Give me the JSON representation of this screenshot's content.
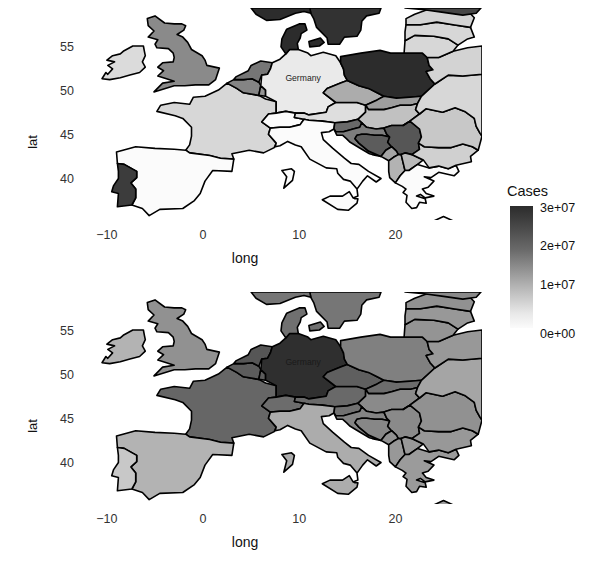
{
  "figure": {
    "type": "choropleth-map-pair",
    "region": "Europe"
  },
  "panels": [
    {
      "id": "top",
      "axis": {
        "xlabel": "long",
        "ylabel": "lat",
        "xticks": [
          "-10",
          "0",
          "10",
          "20"
        ],
        "xtick_values": [
          -10,
          0,
          10,
          20
        ],
        "yticks": [
          "55",
          "50",
          "45",
          "40"
        ],
        "ytick_values": [
          55,
          50,
          45,
          40
        ],
        "xlim": [
          -13,
          29
        ],
        "ylim": [
          35.5,
          59.5
        ]
      },
      "annotation": {
        "label": "Germany",
        "long": 10.4,
        "lat": 51.2,
        "text_color": "#222222"
      }
    },
    {
      "id": "bottom",
      "axis": {
        "xlabel": "long",
        "ylabel": "lat",
        "xticks": [
          "-10",
          "0",
          "10",
          "20"
        ],
        "xtick_values": [
          -10,
          0,
          10,
          20
        ],
        "yticks": [
          "55",
          "50",
          "45",
          "40"
        ],
        "ytick_values": [
          55,
          50,
          45,
          40
        ],
        "xlim": [
          -13,
          29
        ],
        "ylim": [
          35.5,
          59.5
        ]
      },
      "annotation": {
        "label": "Germany",
        "long": 10.4,
        "lat": 51.2,
        "text_color": "#1a1a1a"
      }
    }
  ],
  "legend": {
    "title": "Cases",
    "ticks": [
      "3e+07",
      "2e+07",
      "1e+07",
      "0e+00"
    ],
    "tick_values": [
      30000000,
      20000000,
      10000000,
      0
    ],
    "gradient_high_color": "#2c2c2c",
    "gradient_low_color": "#fbfbfb",
    "orientation": "vertical"
  },
  "chart_data": {
    "type": "heatmap",
    "title": "",
    "xlabel": "long",
    "ylabel": "lat",
    "legend_title": "Cases",
    "legend_ticks": [
      0,
      10000000,
      20000000,
      30000000
    ],
    "legend_tick_labels": [
      "0e+00",
      "1e+07",
      "2e+07",
      "3e+07"
    ],
    "xlim": [
      -13,
      29
    ],
    "ylim": [
      35.5,
      59.5
    ],
    "grid": false,
    "legend_position": "right",
    "panels": [
      {
        "name": "top",
        "annotation": "Germany",
        "values": {
          "Ireland": 4000000,
          "United Kingdom": 15500000,
          "France": 4500000,
          "Spain": 0,
          "Portugal": 27500000,
          "Belgium": 16500000,
          "Netherlands": 18500000,
          "Luxembourg": 14000000,
          "Germany": 2000000,
          "Switzerland": 0,
          "Austria": 3500000,
          "Italy": 0,
          "Denmark": 30000000,
          "Norway": 30000000,
          "Sweden": 29000000,
          "Finland": 26000000,
          "Poland": 30000000,
          "Czechia": 10500000,
          "Slovakia": 12500000,
          "Hungary": 7500000,
          "Slovenia": 20500000,
          "Croatia": 17500000,
          "Bosnia and Herzegovina": 22500000,
          "Serbia": 23500000,
          "Montenegro": 11500000,
          "Albania": 9500000,
          "North Macedonia": 8500000,
          "Greece": 0,
          "Bulgaria": 5500000,
          "Romania": 6500000,
          "Ukraine": 4500000,
          "Belarus": 5000000,
          "Lithuania": 4500000,
          "Latvia": 4500000,
          "Estonia": 5000000
        }
      },
      {
        "name": "bottom",
        "annotation": "Germany",
        "values": {
          "Ireland": 9500000,
          "United Kingdom": 14500000,
          "France": 21000000,
          "Spain": 9500000,
          "Portugal": 6500000,
          "Belgium": 22500000,
          "Netherlands": 23500000,
          "Luxembourg": 22500000,
          "Germany": 29500000,
          "Switzerland": 20000000,
          "Austria": 20500000,
          "Italy": 10500000,
          "Denmark": 19500000,
          "Norway": 18500000,
          "Sweden": 18500000,
          "Finland": 15500000,
          "Poland": 17000000,
          "Czechia": 22000000,
          "Slovakia": 20000000,
          "Hungary": 15500000,
          "Slovenia": 19500000,
          "Croatia": 16500000,
          "Bosnia and Herzegovina": 16000000,
          "Serbia": 15500000,
          "Montenegro": 14500000,
          "Albania": 13500000,
          "North Macedonia": 13500000,
          "Greece": 13000000,
          "Bulgaria": 13500000,
          "Romania": 14500000,
          "Ukraine": 11500000,
          "Belarus": 13500000,
          "Lithuania": 14000000,
          "Latvia": 13500000,
          "Estonia": 14500000
        }
      }
    ]
  },
  "geometry": {
    "proj": {
      "x0": -13,
      "x1": 29,
      "y0": 35.5,
      "y1": 59.5,
      "w": 404,
      "h": 212
    },
    "countries": [
      {
        "name": "Ireland",
        "d": "M -10.5,51.5 L -10.1,52.2 L -9.9,52.0 L -9.4,52.6 L -9.9,53.0 L -9.2,53.4 L -10.0,53.6 L -9.4,54.1 L -8.6,54.3 L -8.3,54.6 L -7.3,55.2 L -6.2,55.2 L -6.1,54.6 L -6.0,54.1 L -6.3,53.4 L -6.0,52.8 L -6.6,52.2 L -7.6,51.9 L -8.6,51.6 L -9.7,51.4 Z"
      },
      {
        "name": "United Kingdom",
        "d": "M -5.1,50.0 L -3.0,50.7 L -1.9,50.7 L -0.8,50.8 L 0.6,50.8 L 1.3,51.4 L 1.7,52.7 L 0.4,53.0 L 0.2,53.6 L -0.1,54.1 L -1.2,54.8 L -1.6,55.6 L -2.1,56.2 L -2.7,56.5 L -2.0,57.0 L -1.8,57.5 L -2.2,57.7 L -3.0,57.7 L -4.0,57.8 L -5.0,58.6 L -5.8,58.3 L -5.7,57.5 L -5.1,56.9 L -5.7,56.2 L -4.7,55.9 L -5.0,55.4 L -4.8,55.0 L -3.6,54.9 L -3.1,54.4 L -3.0,53.9 L -3.1,53.4 L -4.2,53.3 L -4.7,52.8 L -4.1,52.4 L -4.7,51.8 L -3.8,51.5 L -3.0,51.2 L -4.2,51.0 L -5.1,50.0 Z"
      },
      {
        "name": "France",
        "d": "M -1.8,43.4 L -1.4,44.0 L -1.2,45.0 L -1.2,46.0 L -2.1,47.0 L -2.9,47.3 L -4.8,47.8 L -4.4,48.5 L -3.0,48.8 L -1.4,48.6 L -1.0,49.4 L 0.2,49.5 L 1.6,50.2 L 2.5,51.0 L 3.5,50.4 L 4.2,49.9 L 5.8,49.6 L 6.5,49.2 L 7.6,48.9 L 7.6,47.6 L 6.8,47.5 L 6.1,46.6 L 7.0,45.9 L 6.8,45.2 L 7.6,44.2 L 7.4,43.7 L 6.3,43.1 L 4.8,43.4 L 3.0,43.0 L 3.2,42.4 L 1.8,42.5 L 0.7,42.8 L -1.4,43.1 L -1.8,43.4 Z"
      },
      {
        "name": "Spain",
        "d": "M -9.0,43.2 L -7.0,43.8 L -5.0,43.6 L -3.0,43.5 L -1.8,43.4 L -1.4,43.1 L 0.7,42.8 L 1.8,42.5 L 3.2,42.4 L 3.0,41.0 L 1.0,41.1 L 0.2,39.9 L -0.3,38.5 L -0.9,37.7 L -2.1,36.8 L -4.5,36.7 L -5.6,36.0 L -6.3,36.8 L -7.4,37.2 L -7.0,38.0 L -7.0,39.0 L -7.5,39.7 L -6.9,40.3 L -6.9,41.0 L -8.2,41.8 L -8.9,41.9 L -9.0,43.2 Z"
      },
      {
        "name": "Portugal",
        "d": "M -8.9,41.9 L -8.2,41.8 L -6.9,41.0 L -6.9,40.3 L -7.5,39.7 L -7.0,39.0 L -7.0,38.0 L -7.4,37.2 L -8.9,37.0 L -8.8,38.5 L -9.5,38.7 L -9.3,39.4 L -8.8,40.2 L -8.8,41.0 L -8.9,41.9 Z"
      },
      {
        "name": "Belgium",
        "d": "M 2.5,51.0 L 3.2,51.4 L 4.2,51.4 L 5.1,51.5 L 5.8,51.1 L 6.0,50.7 L 5.8,49.6 L 4.2,49.9 L 3.5,50.4 L 2.5,51.0 Z"
      },
      {
        "name": "Luxembourg",
        "d": "M 5.8,49.6 L 6.0,50.7 L 6.5,50.2 L 6.5,49.5 L 5.8,49.6 Z"
      },
      {
        "name": "Netherlands",
        "d": "M 3.2,51.4 L 3.4,51.7 L 4.7,52.4 L 5.0,53.0 L 6.0,53.5 L 7.2,53.3 L 7.0,52.6 L 6.7,52.0 L 6.1,51.9 L 5.8,51.1 L 5.1,51.5 L 4.2,51.4 L 3.2,51.4 Z"
      },
      {
        "name": "Germany",
        "d": "M 6.0,50.7 L 6.1,51.9 L 6.7,52.0 L 7.0,52.6 L 7.2,53.3 L 8.0,53.7 L 8.6,54.3 L 9.0,54.8 L 9.9,54.8 L 10.9,54.4 L 11.2,54.1 L 12.5,54.5 L 13.8,54.1 L 14.3,53.3 L 14.6,52.6 L 14.7,51.9 L 15.0,51.3 L 14.3,51.0 L 12.9,50.4 L 12.5,49.9 L 13.8,48.8 L 13.0,48.3 L 12.8,47.7 L 11.0,47.4 L 10.5,47.6 L 9.6,47.6 L 8.6,47.8 L 7.6,47.6 L 7.6,48.9 L 6.5,49.5 L 6.5,50.2 L 6.0,50.7 Z"
      },
      {
        "name": "Denmark",
        "d": "M 8.6,54.3 L 8.1,55.1 L 8.2,56.0 L 8.7,57.1 L 10.0,57.7 L 10.6,57.7 L 10.8,57.0 L 10.2,56.6 L 10.1,56.1 L 9.8,55.5 L 9.9,54.8 L 9.0,54.8 L 8.6,54.3 Z M 11.1,55.1 L 11.0,55.7 L 12.2,56.1 L 12.6,55.6 L 12.1,55.2 L 11.1,55.1 Z"
      },
      {
        "name": "Switzerland",
        "d": "M 6.1,46.6 L 6.8,47.5 L 7.6,47.6 L 8.6,47.8 L 9.6,47.6 L 9.5,47.1 L 10.5,46.9 L 10.1,46.3 L 9.0,46.0 L 8.0,46.0 L 7.0,45.9 L 6.1,46.6 Z"
      },
      {
        "name": "Austria",
        "d": "M 9.6,47.6 L 10.5,47.6 L 11.0,47.4 L 12.8,47.7 L 13.0,48.3 L 13.8,48.8 L 14.8,48.8 L 16.0,48.8 L 16.9,48.5 L 16.9,47.7 L 16.1,46.9 L 15.0,46.6 L 13.7,46.5 L 12.4,46.7 L 11.0,46.8 L 10.5,46.9 L 9.5,47.1 L 9.6,47.6 Z"
      },
      {
        "name": "Italy",
        "d": "M 7.0,45.9 L 8.0,46.0 L 9.0,46.0 L 10.1,46.3 L 10.5,46.9 L 11.0,46.8 L 12.4,46.7 L 13.7,46.5 L 13.6,45.8 L 13.1,45.5 L 12.3,45.4 L 12.5,44.6 L 13.5,43.6 L 14.7,42.5 L 15.4,41.9 L 16.2,41.8 L 17.2,41.0 L 18.5,40.2 L 18.0,39.8 L 17.1,40.5 L 16.6,39.9 L 16.0,39.0 L 16.1,38.2 L 15.6,38.0 L 15.8,37.9 L 16.1,37.9 L 16.0,37.4 L 15.1,36.6 L 14.0,36.7 L 12.4,37.8 L 13.2,38.2 L 14.5,38.2 L 15.2,38.7 L 15.6,38.0 L 16.1,38.2 L 16.0,39.0 L 15.3,39.9 L 14.6,40.1 L 14.0,40.8 L 13.9,41.3 L 12.8,41.4 L 11.1,42.4 L 10.2,43.8 L 9.6,44.0 L 8.8,44.4 L 8.0,43.9 L 7.5,43.8 L 7.6,44.2 L 6.8,45.2 L 7.0,45.9 Z M 9.5,41.0 L 9.3,40.0 L 8.4,39.1 L 8.7,40.4 L 8.2,41.1 L 9.2,41.3 L 9.5,41.0 Z"
      },
      {
        "name": "Czechia",
        "d": "M 12.5,49.9 L 12.9,50.4 L 14.3,51.0 L 15.0,51.3 L 16.2,50.7 L 17.2,50.4 L 18.1,49.9 L 18.8,49.5 L 18.1,49.1 L 16.9,48.5 L 16.0,48.8 L 14.8,48.8 L 13.8,48.8 L 12.5,49.9 Z"
      },
      {
        "name": "Poland",
        "d": "M 14.3,53.3 L 14.3,54.0 L 16.4,54.4 L 18.4,54.7 L 19.5,54.4 L 20.9,54.4 L 22.8,54.4 L 23.3,53.9 L 23.5,53.0 L 23.9,52.5 L 23.2,52.3 L 23.6,51.5 L 24.1,50.9 L 22.7,49.5 L 21.5,49.4 L 20.1,49.3 L 18.8,49.5 L 18.1,49.9 L 17.2,50.4 L 16.2,50.7 L 15.0,51.3 L 14.7,51.9 L 14.6,52.6 L 14.3,53.3 Z"
      },
      {
        "name": "Slovakia",
        "d": "M 18.8,49.5 L 20.1,49.3 L 21.5,49.4 L 22.7,49.5 L 22.3,48.7 L 21.6,48.5 L 20.5,48.5 L 19.6,48.2 L 18.8,48.0 L 18.1,48.0 L 17.2,48.0 L 16.9,48.5 L 18.1,49.1 L 18.8,49.5 Z"
      },
      {
        "name": "Hungary",
        "d": "M 16.9,47.7 L 16.9,48.5 L 17.2,48.0 L 18.1,48.0 L 18.8,48.0 L 19.6,48.2 L 20.5,48.5 L 21.6,48.5 L 22.3,48.7 L 22.1,48.0 L 22.5,47.5 L 21.5,46.7 L 20.8,46.2 L 19.6,46.2 L 18.8,45.9 L 18.0,45.8 L 17.0,46.0 L 16.5,46.5 L 16.1,46.9 L 16.9,47.7 Z"
      },
      {
        "name": "Slovenia",
        "d": "M 13.7,46.5 L 15.0,46.6 L 16.1,46.9 L 16.5,46.5 L 16.3,46.0 L 15.6,45.8 L 14.6,45.5 L 13.8,45.5 L 13.6,45.8 L 13.7,46.5 Z"
      },
      {
        "name": "Croatia",
        "d": "M 13.6,45.8 L 13.8,45.5 L 14.6,45.5 L 15.6,45.8 L 16.3,46.0 L 16.5,46.5 L 17.0,46.0 L 18.0,45.8 L 18.8,45.9 L 19.1,45.2 L 19.4,44.9 L 18.6,45.1 L 17.8,45.1 L 17.0,45.2 L 16.5,45.2 L 16.0,45.1 L 15.8,44.7 L 16.2,44.2 L 17.2,43.3 L 18.5,42.7 L 17.6,42.9 L 17.3,43.0 L 16.5,43.5 L 15.9,43.9 L 15.3,44.3 L 14.9,44.7 L 14.5,45.1 L 13.9,45.1 L 13.6,45.8 Z"
      },
      {
        "name": "Bosnia and Herzegovina",
        "d": "M 15.8,44.7 L 16.0,45.1 L 16.5,45.2 L 17.0,45.2 L 17.8,45.1 L 18.6,45.1 L 19.4,44.9 L 19.2,44.3 L 19.6,43.8 L 19.0,43.4 L 18.5,42.7 L 17.2,43.3 L 16.2,44.2 L 15.8,44.7 Z"
      },
      {
        "name": "Serbia",
        "d": "M 19.4,44.9 L 19.1,45.2 L 18.8,45.9 L 19.6,46.2 L 20.8,46.2 L 21.5,46.7 L 22.5,45.8 L 22.7,44.9 L 22.4,44.2 L 22.5,43.5 L 21.7,42.9 L 21.0,43.1 L 20.6,42.9 L 20.3,42.9 L 20.1,43.3 L 19.6,43.8 L 19.2,44.3 L 19.4,44.9 Z"
      },
      {
        "name": "Montenegro",
        "d": "M 18.5,42.7 L 19.0,43.4 L 19.6,43.8 L 20.1,43.3 L 20.3,42.9 L 19.8,42.6 L 19.3,42.2 L 18.5,42.7 Z"
      },
      {
        "name": "Albania",
        "d": "M 19.3,42.2 L 19.8,42.6 L 20.3,42.9 L 20.6,42.9 L 20.8,42.0 L 21.0,41.1 L 20.5,40.5 L 20.0,39.7 L 19.4,40.3 L 19.3,41.0 L 19.3,42.2 Z"
      },
      {
        "name": "North Macedonia",
        "d": "M 20.8,42.0 L 20.6,42.9 L 21.0,43.1 L 21.7,42.9 L 22.9,42.3 L 22.3,41.8 L 21.4,41.1 L 21.0,41.1 L 20.8,42.0 Z"
      },
      {
        "name": "Greece",
        "d": "M 20.0,39.7 L 20.5,40.5 L 21.0,41.1 L 21.4,41.1 L 22.3,41.8 L 23.5,41.4 L 24.5,41.6 L 25.5,41.3 L 26.3,41.7 L 26.6,41.0 L 26.1,40.5 L 24.5,40.9 L 23.7,40.3 L 23.0,40.4 L 24.0,39.9 L 23.4,39.2 L 22.8,39.0 L 23.2,38.5 L 24.0,38.2 L 23.1,38.0 L 22.6,38.4 L 22.2,38.2 L 23.1,37.9 L 23.2,37.4 L 22.5,37.5 L 22.2,36.9 L 21.7,36.8 L 21.1,37.5 L 21.2,38.3 L 20.8,38.6 L 21.1,39.0 L 20.7,39.3 L 20.0,39.7 Z M 25.0,35.9 L 24.0,35.4 L 25.5,35.0 L 26.2,35.3 L 25.0,35.9 Z"
      },
      {
        "name": "Bulgaria",
        "d": "M 22.5,43.5 L 22.4,44.2 L 23.0,43.8 L 24.5,43.7 L 25.8,43.7 L 27.0,44.1 L 28.0,43.8 L 28.6,43.4 L 27.8,42.7 L 27.9,42.1 L 26.3,41.7 L 25.5,41.3 L 24.5,41.6 L 23.5,41.4 L 22.9,42.3 L 21.7,42.9 L 22.5,43.5 Z"
      },
      {
        "name": "Romania",
        "d": "M 22.4,44.2 L 22.7,44.9 L 22.5,45.8 L 21.5,46.7 L 20.8,46.2 L 21.5,46.7 L 22.5,47.5 L 23.2,48.1 L 24.9,47.7 L 26.2,48.2 L 27.2,47.8 L 28.2,47.0 L 28.4,46.1 L 28.8,45.3 L 29.0,45.0 L 28.6,43.4 L 28.0,43.8 L 27.0,44.1 L 25.8,43.7 L 24.5,43.7 L 23.0,43.8 L 22.4,44.2 Z"
      },
      {
        "name": "Ukraine",
        "d": "M 22.7,49.5 L 24.1,50.9 L 25.5,51.9 L 27.0,51.8 L 29.0,52.0 L 29.0,45.0 L 28.8,45.3 L 28.4,46.1 L 28.2,47.0 L 27.2,47.8 L 26.2,48.2 L 24.9,47.7 L 23.2,48.1 L 22.5,47.5 L 22.1,48.0 L 22.3,48.7 L 22.7,49.5 Z"
      },
      {
        "name": "Belarus",
        "d": "M 23.2,52.3 L 23.9,52.5 L 23.5,53.0 L 23.3,53.9 L 24.5,53.9 L 26.0,54.6 L 27.5,55.0 L 29.0,55.2 L 29.0,52.0 L 27.0,51.8 L 25.5,51.9 L 24.1,50.9 L 23.6,51.5 L 23.2,52.3 Z"
      },
      {
        "name": "Lithuania",
        "d": "M 20.9,54.4 L 22.8,54.4 L 23.3,53.9 L 24.5,53.9 L 26.0,54.6 L 26.5,55.3 L 25.5,56.0 L 24.0,56.3 L 22.0,56.4 L 21.0,55.8 L 20.9,54.4 Z"
      },
      {
        "name": "Latvia",
        "d": "M 21.0,55.8 L 22.0,56.4 L 24.0,56.3 L 25.5,56.0 L 26.5,55.3 L 27.5,56.0 L 28.2,56.2 L 27.8,57.3 L 26.0,57.6 L 24.3,57.9 L 22.6,57.6 L 21.1,57.6 L 21.0,56.8 L 21.0,55.8 Z"
      },
      {
        "name": "Estonia",
        "d": "M 21.1,57.6 L 22.6,57.6 L 24.3,57.9 L 26.0,57.6 L 27.8,57.3 L 28.2,58.4 L 27.5,59.2 L 25.5,59.5 L 23.5,59.4 L 22.0,58.8 L 21.1,58.3 L 21.1,57.6 Z"
      },
      {
        "name": "Sweden",
        "d": "M 11.2,58.9 L 11.1,59.5 L 18.5,59.5 L 18.3,58.9 L 17.0,58.6 L 16.5,58.0 L 16.4,57.0 L 16.0,56.3 L 14.7,56.2 L 14.2,55.4 L 13.0,55.4 L 12.9,56.1 L 11.8,57.3 L 11.5,58.3 L 11.2,58.9 Z"
      },
      {
        "name": "Norway",
        "d": "M 5.0,59.5 L 11.1,59.5 L 11.2,58.9 L 10.5,59.1 L 9.6,58.9 L 8.0,58.2 L 6.6,58.1 L 5.5,58.8 L 5.0,59.5 Z"
      },
      {
        "name": "Finland",
        "d": "M 21.0,59.5 L 28.9,59.5 L 28.4,58.9 L 27.0,58.7 L 25.0,59.0 L 23.0,59.3 L 21.0,59.5 Z"
      }
    ]
  }
}
